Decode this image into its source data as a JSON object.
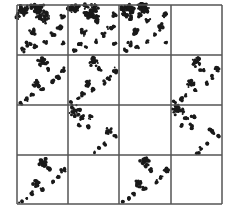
{
  "figure": {
    "rows": 4,
    "cols": 4,
    "colors": {
      "ink": "#1a1a1a",
      "grid": "#555555",
      "background": "#ffffff"
    },
    "cells": [
      [
        "dense",
        "dense",
        "dense",
        "empty"
      ],
      [
        "sparse",
        "sparse",
        "empty",
        "sparse"
      ],
      [
        "empty",
        "dense-corner",
        "empty",
        "dense-corner"
      ],
      [
        "sparse",
        "empty",
        "sparse",
        "empty"
      ]
    ]
  }
}
